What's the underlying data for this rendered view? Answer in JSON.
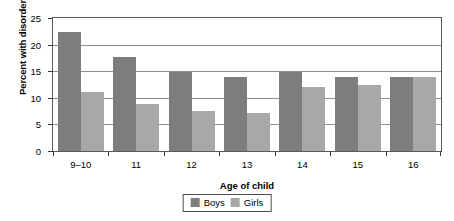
{
  "chart_data": {
    "type": "bar",
    "title": "",
    "subtitle": "",
    "xlabel": "Age of child",
    "ylabel": "Percent with disorder",
    "categories": [
      "9–10",
      "11",
      "12",
      "13",
      "14",
      "15",
      "16"
    ],
    "series": [
      {
        "name": "Boys",
        "color": "#7d7d7d",
        "values": [
          22.3,
          17.7,
          14.9,
          13.9,
          14.9,
          13.9,
          14.0
        ]
      },
      {
        "name": "Girls",
        "color": "#a8a8a8",
        "values": [
          11.0,
          8.9,
          7.6,
          7.2,
          12.0,
          12.4,
          14.0
        ]
      }
    ],
    "ylim": [
      0,
      25
    ],
    "yticks": [
      0,
      5,
      10,
      15,
      20,
      25
    ],
    "ytick_labels": [
      "0",
      "5",
      "10",
      "15",
      "20",
      "25"
    ],
    "grid": true,
    "grid_axis": "y",
    "legend_position": "bottom-center",
    "bar_mode": "grouped"
  },
  "colors": {
    "boys": "#7d7d7d",
    "girls": "#a8a8a8",
    "axis": "#3a3a3a",
    "gridline": "#8d8d8d",
    "frame": "#5a5a5a",
    "background": "#ffffff",
    "text": "#000000"
  }
}
